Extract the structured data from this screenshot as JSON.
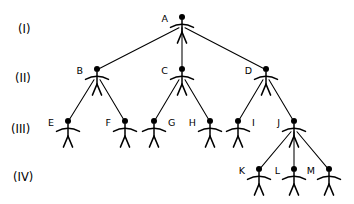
{
  "diagram": {
    "background_color": "#ffffff",
    "ink_color": "#000000",
    "levels": [
      {
        "id": "level-1",
        "label": "(I)",
        "label_x": 18,
        "label_y": 33
      },
      {
        "id": "level-2",
        "label": "(II)",
        "label_x": 15,
        "label_y": 82
      },
      {
        "id": "level-3",
        "label": "(III)",
        "label_x": 11,
        "label_y": 133
      },
      {
        "id": "level-4",
        "label": "(IV)",
        "label_x": 13,
        "label_y": 181
      }
    ],
    "nodes": [
      {
        "id": "A",
        "label": "A",
        "level": 1,
        "x": 182,
        "y": 17,
        "label_side": "left"
      },
      {
        "id": "B",
        "label": "B",
        "level": 2,
        "x": 97,
        "y": 69,
        "label_side": "left"
      },
      {
        "id": "C",
        "label": "C",
        "level": 2,
        "x": 182,
        "y": 69,
        "label_side": "left"
      },
      {
        "id": "D",
        "label": "D",
        "level": 2,
        "x": 266,
        "y": 69,
        "label_side": "left"
      },
      {
        "id": "E",
        "label": "E",
        "level": 3,
        "x": 68,
        "y": 121,
        "label_side": "left"
      },
      {
        "id": "F",
        "label": "F",
        "level": 3,
        "x": 125,
        "y": 121,
        "label_side": "left"
      },
      {
        "id": "G",
        "label": "G",
        "level": 3,
        "x": 154,
        "y": 121,
        "label_side": "right"
      },
      {
        "id": "H",
        "label": "H",
        "level": 3,
        "x": 210,
        "y": 121,
        "label_side": "left"
      },
      {
        "id": "I",
        "label": "I",
        "level": 3,
        "x": 238,
        "y": 121,
        "label_side": "right"
      },
      {
        "id": "J",
        "label": "J",
        "level": 3,
        "x": 294,
        "y": 121,
        "label_side": "left"
      },
      {
        "id": "K",
        "label": "K",
        "level": 4,
        "x": 259,
        "y": 169,
        "label_side": "left"
      },
      {
        "id": "L",
        "label": "L",
        "level": 4,
        "x": 294,
        "y": 169,
        "label_side": "left"
      },
      {
        "id": "M",
        "label": "M",
        "level": 4,
        "x": 329,
        "y": 169,
        "label_side": "left"
      }
    ],
    "edges": [
      {
        "from": "A",
        "to": "B"
      },
      {
        "from": "A",
        "to": "C"
      },
      {
        "from": "A",
        "to": "D"
      },
      {
        "from": "B",
        "to": "E"
      },
      {
        "from": "B",
        "to": "F"
      },
      {
        "from": "C",
        "to": "G"
      },
      {
        "from": "C",
        "to": "H"
      },
      {
        "from": "D",
        "to": "I"
      },
      {
        "from": "D",
        "to": "J"
      },
      {
        "from": "J",
        "to": "K"
      },
      {
        "from": "J",
        "to": "L"
      },
      {
        "from": "J",
        "to": "M"
      }
    ],
    "figure_geometry": {
      "head_radius": 3.0,
      "neck_offset": 3.6,
      "torso_length": 11.5,
      "arm_half_width": 11.5,
      "arm_drop": 2.6,
      "arm_y_offset": 4.2,
      "leg_length": 11.0,
      "leg_spread": 4.6
    }
  }
}
